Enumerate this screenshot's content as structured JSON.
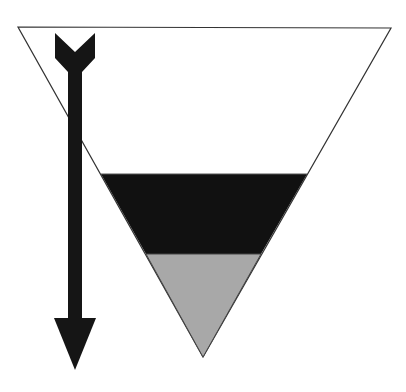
{
  "diagram": {
    "type": "inverted-triangle-layers",
    "colors": {
      "background": "#ffffff",
      "outline": "#333333",
      "upper_layer": "#ffffff",
      "middle_layer": "#111111",
      "bottom_layer": "#a8a8a8",
      "arrow": "#151515"
    },
    "triangle": {
      "top_left": [
        18,
        27
      ],
      "top_right": [
        391,
        28
      ],
      "apex": [
        203,
        357
      ]
    },
    "layers": [
      {
        "name": "upper",
        "y_top": 27,
        "y_bottom": 174
      },
      {
        "name": "middle",
        "y_top": 174,
        "y_bottom": 254
      },
      {
        "name": "bottom",
        "y_top": 254,
        "y_bottom": 357
      }
    ],
    "arrow": {
      "direction": "down",
      "x": 75,
      "y_start": 33,
      "y_end": 370
    }
  }
}
